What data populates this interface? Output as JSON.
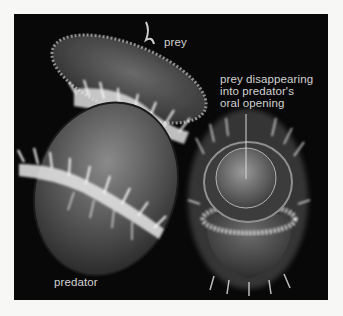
{
  "figure": {
    "labels": {
      "prey": "prey",
      "predator": "predator",
      "oral_opening": [
        "prey disappearing",
        "into predator's",
        "oral opening"
      ]
    },
    "colors": {
      "page_background": "#f7f7f5",
      "micrograph_background": "#080808",
      "label_text": "#d2d2d2"
    }
  }
}
